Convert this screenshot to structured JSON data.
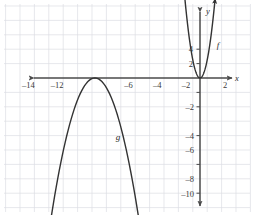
{
  "figure": {
    "background_color": "#ffffff",
    "grid_color": "#d7d9e0",
    "grid_minor_color": "#e9eaef",
    "axis_color": "#4a4a4a",
    "curve_color": "#333333"
  },
  "chart_data": {
    "type": "line",
    "title": "",
    "xlabel": "x",
    "ylabel": "y",
    "xlim": [
      -16,
      3.6
    ],
    "ylim": [
      -11,
      5.6
    ],
    "grid": true,
    "legend": "inline-labels",
    "unit_px": 14.4,
    "origin_px": [
      200,
      78
    ],
    "x_ticks": [
      -14,
      -12,
      -6,
      -4,
      -2,
      2
    ],
    "x_tick_labels": [
      "–14",
      "–12",
      "–6",
      "–4",
      "–2",
      "2"
    ],
    "y_ticks": [
      4,
      2,
      -2,
      -4,
      -6,
      -8,
      -10
    ],
    "y_tick_labels": [
      "4",
      "2",
      "–2",
      "–4",
      "–6",
      "–8",
      "–10"
    ],
    "series": [
      {
        "name": "f",
        "label": "f",
        "label_position": [
          1.25,
          2.1
        ],
        "description": "narrow upward parabola, vertex at origin",
        "vertex": [
          0,
          0
        ],
        "leading_coefficient": 5,
        "x_domain": [
          -1.05,
          1.05
        ],
        "arrow_start": true,
        "arrow_end": true
      },
      {
        "name": "g",
        "label": "g",
        "label_position": [
          -5.7,
          -4.3
        ],
        "description": "downward parabola, vertex on x-axis near x = -7.3",
        "vertex": [
          -7.3,
          0
        ],
        "leading_coefficient": -1.05,
        "x_domain": [
          -10.4,
          -4.2
        ],
        "arrow_start": true,
        "arrow_end": true
      }
    ],
    "axis_arrows": {
      "x_left": true,
      "x_right": true,
      "y_up": true,
      "y_down": true
    }
  }
}
